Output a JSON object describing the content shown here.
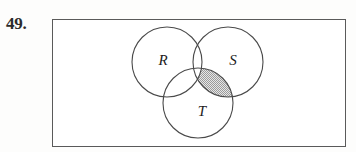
{
  "problem": {
    "number_label": "49.",
    "figure_type": "venn-diagram",
    "set_count": 3
  },
  "universe": {
    "shape": "rectangle",
    "border_color": "#5a5a5a",
    "fill_color": "#ffffff",
    "x": 52,
    "y": 19,
    "width": 294,
    "height": 128
  },
  "sets": [
    {
      "id": "R",
      "label": "R",
      "label_x": 163,
      "label_y": 62,
      "cx": 167,
      "cy": 62,
      "r": 35,
      "stroke_color": "#4a4a4a",
      "fill_color": "none"
    },
    {
      "id": "S",
      "label": "S",
      "label_x": 233,
      "label_y": 62,
      "cx": 228,
      "cy": 62,
      "r": 35,
      "stroke_color": "#4a4a4a",
      "fill_color": "none"
    },
    {
      "id": "T",
      "label": "T",
      "label_x": 202,
      "label_y": 113,
      "cx": 198,
      "cy": 103,
      "r": 35,
      "stroke_color": "#4a4a4a",
      "fill_color": "none"
    }
  ],
  "shaded_region": {
    "description": "S intersect T, excluding R",
    "includes": [
      "S",
      "T"
    ],
    "excludes": [
      "R"
    ],
    "fill_pattern": "gray-stipple",
    "fill_color": "#a9a9a9",
    "pattern_background": "#e8e8e8"
  },
  "colors": {
    "page_background": "#fdfdfc",
    "ink": "#2b2b2b",
    "circle_stroke": "#4a4a4a",
    "rect_stroke": "#5a5a5a"
  }
}
